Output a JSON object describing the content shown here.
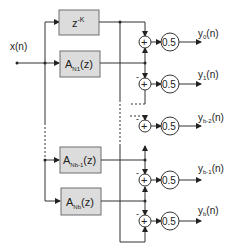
{
  "diagram": {
    "input_label": "x(n)",
    "blocks": [
      {
        "id": "delay",
        "main": "z",
        "sup": "-K",
        "sub": ""
      },
      {
        "id": "a_n1",
        "main": "A",
        "sub": "N1",
        "tail": "(z)"
      },
      {
        "id": "a_nb_1",
        "main": "A",
        "sub": "Nb-1",
        "tail": "(z)"
      },
      {
        "id": "a_nb",
        "main": "A",
        "sub": "Nb",
        "tail": "(z)"
      }
    ],
    "adder_symbol": "+",
    "minus_sign": "-",
    "gain_label": "0.5",
    "outputs": [
      {
        "main": "y",
        "sub": "0",
        "tail": "(n)"
      },
      {
        "main": "y",
        "sub": "1",
        "tail": "(n)"
      },
      {
        "main": "y",
        "sub": "b-2",
        "tail": "(n)"
      },
      {
        "main": "y",
        "sub": "b-1",
        "tail": "(n)"
      },
      {
        "main": "y",
        "sub": "b",
        "tail": "(n)"
      }
    ]
  }
}
